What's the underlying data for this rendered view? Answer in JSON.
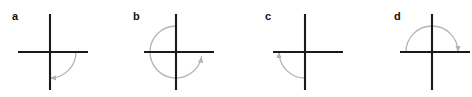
{
  "figure": {
    "background_color": "#ffffff",
    "width": 472,
    "height": 97,
    "axis_color": "#1a1a1a",
    "arc_color": "#b3b3b3",
    "label_color": "#111111"
  },
  "panels": [
    {
      "id": "panel-a",
      "label": "a",
      "label_x": 12,
      "label_y": 11,
      "panel_left": 0,
      "origin_x": 50,
      "origin_y": 52,
      "x_axis_left": 18,
      "x_axis_right": 88,
      "y_axis_top": 14,
      "y_axis_bottom": 90,
      "arc_radius": 26,
      "arc_start_deg": 0,
      "arc_end_deg": -90,
      "arc_direction": "clockwise",
      "arc_sweep_deg": 90,
      "arrow_at": "negative-y-axis",
      "description": "arc from positive x-axis clockwise to negative y-axis"
    },
    {
      "id": "panel-b",
      "label": "b",
      "label_x": 133,
      "label_y": 11,
      "panel_left": 118,
      "origin_x": 176,
      "origin_y": 52,
      "x_axis_left": 144,
      "x_axis_right": 214,
      "y_axis_top": 14,
      "y_axis_bottom": 90,
      "arc_radius": 26,
      "arc_start_deg": 90,
      "arc_end_deg": -10,
      "arc_direction": "counterclockwise",
      "arc_sweep_deg": 340,
      "arrow_at": "positive-x-axis",
      "description": "arc from positive y-axis counterclockwise almost full turn to positive x-axis"
    },
    {
      "id": "panel-c",
      "label": "c",
      "label_x": 265,
      "label_y": 11,
      "panel_left": 236,
      "origin_x": 305,
      "origin_y": 52,
      "x_axis_left": 273,
      "x_axis_right": 343,
      "y_axis_top": 14,
      "y_axis_bottom": 90,
      "arc_radius": 26,
      "arc_start_deg": -90,
      "arc_end_deg": 180,
      "arc_direction": "clockwise",
      "arc_sweep_deg": 90,
      "arrow_at": "negative-x-axis",
      "description": "arc from negative y-axis clockwise to negative x-axis"
    },
    {
      "id": "panel-d",
      "label": "d",
      "label_x": 394,
      "label_y": 11,
      "panel_left": 354,
      "origin_x": 432,
      "origin_y": 52,
      "x_axis_left": 400,
      "x_axis_right": 470,
      "y_axis_top": 14,
      "y_axis_bottom": 90,
      "arc_radius": 26,
      "arc_start_deg": 180,
      "arc_end_deg": 0,
      "arc_direction": "clockwise",
      "arc_sweep_deg": 180,
      "arrow_at": "positive-x-axis",
      "description": "semicircular arc from negative x-axis clockwise through negative y-axis to positive x-axis"
    }
  ]
}
